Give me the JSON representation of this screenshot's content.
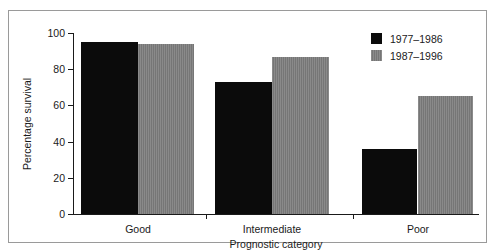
{
  "chart_data": {
    "type": "bar",
    "title": "",
    "subtitle": "",
    "xlabel": "Prognostic category",
    "ylabel": "Percentage survival",
    "categories": [
      "Good",
      "Intermediate",
      "Poor"
    ],
    "series": [
      {
        "name": "1977–1986",
        "color": "#0b0b0b",
        "values": [
          95,
          73,
          36
        ]
      },
      {
        "name": "1987–1996",
        "color": "#7d7d7d",
        "values": [
          94,
          87,
          65
        ]
      }
    ],
    "ylim": [
      0,
      100
    ],
    "yticks": [
      0,
      20,
      40,
      60,
      80,
      100
    ],
    "ytick_labels": [
      "0",
      "20",
      "40",
      "60",
      "80",
      "100"
    ],
    "grid": false,
    "legend_position": "top-right"
  },
  "legend": {
    "entries": [
      {
        "label": "1977–1986",
        "swatch": "black"
      },
      {
        "label": "1987–1996",
        "swatch": "gray"
      }
    ]
  }
}
